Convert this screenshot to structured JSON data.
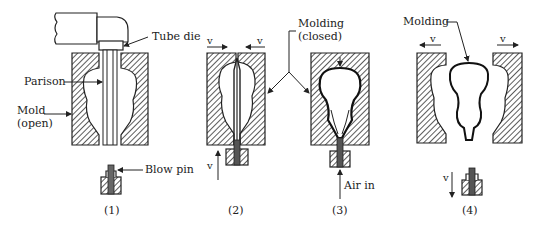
{
  "diagram": {
    "steps": [
      {
        "id": "1",
        "caption": "(1)"
      },
      {
        "id": "2",
        "caption": "(2)"
      },
      {
        "id": "3",
        "caption": "(3)"
      },
      {
        "id": "4",
        "caption": "(4)"
      }
    ],
    "labels": {
      "tube_die": "Tube die",
      "parison": "Parison",
      "mold_line1": "Mold",
      "mold_line2": "(open)",
      "blow_pin": "Blow pin",
      "molding_closed_line1": "Molding",
      "molding_closed_line2": "(closed)",
      "air_in": "Air in",
      "molding": "Molding",
      "velocity": "v"
    },
    "colors": {
      "ink": "#222222",
      "hatch": "#333333",
      "background": "#ffffff"
    }
  }
}
